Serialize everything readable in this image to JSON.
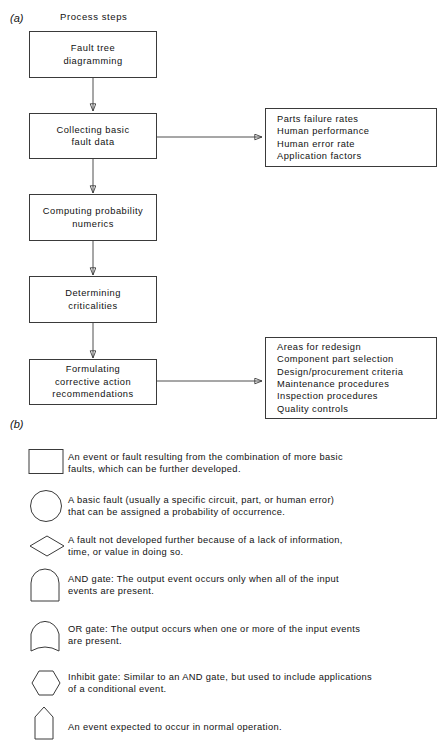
{
  "panels": {
    "a_label": "(a)",
    "b_label": "(b)"
  },
  "figure_a": {
    "heading": "Process steps",
    "steps": [
      {
        "name": "fault-tree-diagramming",
        "text": "Fault tree\ndiagramming"
      },
      {
        "name": "collecting-basic-fault-data",
        "text": "Collecting basic\nfault data"
      },
      {
        "name": "computing-probability-numerics",
        "text": "Computing probability\nnumerics"
      },
      {
        "name": "determining-criticalities",
        "text": "Determining\ncriticalities"
      },
      {
        "name": "formulating-corrective-action-recommendations",
        "text": "Formulating\ncorrective action\nrecommendations"
      }
    ],
    "outputs": [
      {
        "name": "fault-data-inputs",
        "items": [
          "Parts failure rates",
          "Human performance",
          "Human error rate",
          "Application factors"
        ],
        "text": "Parts failure rates\nHuman performance\nHuman error rate\nApplication factors"
      },
      {
        "name": "corrective-action-outputs",
        "items": [
          "Areas for redesign",
          "Component part selection",
          "Design/procurement criteria",
          "Maintenance procedures",
          "Inspection procedures",
          "Quality controls"
        ],
        "text": "Areas for redesign\nComponent part selection\nDesign/procurement criteria\nMaintenance procedures\nInspection procedures\nQuality controls"
      }
    ]
  },
  "figure_b": {
    "entries": [
      {
        "symbol": "rectangle",
        "symbol_name": "event-rectangle-symbol",
        "text": "An event or fault resulting from the combination of more basic\nfaults, which can be further developed."
      },
      {
        "symbol": "circle",
        "symbol_name": "basic-fault-circle-symbol",
        "text": "A basic fault (usually a specific circuit, part, or human error)\nthat can be assigned a probability of occurrence."
      },
      {
        "symbol": "diamond",
        "symbol_name": "undeveloped-diamond-symbol",
        "text": "A fault not developed further because of a lack of information,\ntime, or value in doing so."
      },
      {
        "symbol": "and-gate",
        "symbol_name": "and-gate-symbol",
        "text": "AND gate: The output event occurs only when all of the input\nevents are present."
      },
      {
        "symbol": "or-gate",
        "symbol_name": "or-gate-symbol",
        "text": "OR gate: The output occurs when one or more of the input events\nare present."
      },
      {
        "symbol": "hexagon",
        "symbol_name": "inhibit-gate-symbol",
        "text": "Inhibit gate: Similar to an AND gate, but used to include applications\nof a conditional event."
      },
      {
        "symbol": "house",
        "symbol_name": "house-event-symbol",
        "text": "An event expected to occur in normal operation."
      }
    ]
  },
  "colors": {
    "stroke": "#3a3a3a",
    "text": "#111111",
    "background": "#ffffff"
  }
}
